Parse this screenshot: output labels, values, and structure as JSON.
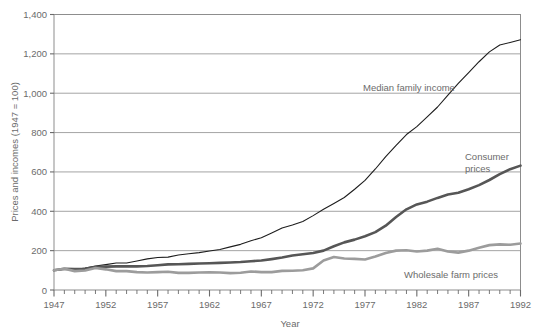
{
  "chart_data": {
    "type": "line",
    "title": "",
    "xlabel": "Year",
    "ylabel": "Prices and incomes (1947 = 100)",
    "xlim": [
      1947,
      1992
    ],
    "ylim": [
      0,
      1400
    ],
    "ytick_labels": [
      "0",
      "200",
      "400",
      "600",
      "800",
      "1,000",
      "1,200",
      "1,400"
    ],
    "ytick_values": [
      0,
      200,
      400,
      600,
      800,
      1000,
      1200,
      1400
    ],
    "xtick_labels": [
      "1947",
      "1952",
      "1957",
      "1962",
      "1967",
      "1972",
      "1977",
      "1982",
      "1987",
      "1992"
    ],
    "xtick_values": [
      1947,
      1952,
      1957,
      1962,
      1967,
      1972,
      1977,
      1982,
      1987,
      1992
    ],
    "grid": true,
    "legend_position": "inline-annotations",
    "x": [
      1947,
      1948,
      1949,
      1950,
      1951,
      1952,
      1953,
      1954,
      1955,
      1956,
      1957,
      1958,
      1959,
      1960,
      1961,
      1962,
      1963,
      1964,
      1965,
      1966,
      1967,
      1968,
      1969,
      1970,
      1971,
      1972,
      1973,
      1974,
      1975,
      1976,
      1977,
      1978,
      1979,
      1980,
      1981,
      1982,
      1983,
      1984,
      1985,
      1986,
      1987,
      1988,
      1989,
      1990,
      1991,
      1992
    ],
    "series": [
      {
        "name": "Median family income",
        "color": "#1d1d1d",
        "width": 1.1,
        "values": [
          100,
          105,
          104,
          112,
          122,
          129,
          137,
          137,
          147,
          158,
          165,
          167,
          178,
          184,
          190,
          198,
          206,
          219,
          232,
          250,
          266,
          290,
          315,
          330,
          348,
          378,
          410,
          440,
          470,
          512,
          557,
          615,
          678,
          735,
          790,
          830,
          880,
          930,
          990,
          1050,
          1105,
          1160,
          1210,
          1245,
          1258,
          1272
        ]
      },
      {
        "name": "Consumer prices",
        "color": "#565656",
        "width": 2.6,
        "values": [
          100,
          108,
          107,
          108,
          117,
          119,
          120,
          120,
          120,
          122,
          126,
          130,
          131,
          133,
          135,
          136,
          138,
          140,
          142,
          146,
          150,
          157,
          165,
          175,
          182,
          188,
          200,
          222,
          242,
          256,
          273,
          294,
          327,
          371,
          410,
          435,
          449,
          468,
          485,
          494,
          512,
          533,
          559,
          589,
          614,
          632
        ]
      },
      {
        "name": "Wholesale farm prices",
        "color": "#9c9c9c",
        "width": 2.6,
        "values": [
          100,
          108,
          96,
          99,
          112,
          105,
          96,
          96,
          91,
          89,
          91,
          93,
          87,
          87,
          89,
          90,
          89,
          86,
          88,
          94,
          91,
          91,
          97,
          98,
          100,
          110,
          150,
          168,
          160,
          158,
          155,
          170,
          188,
          200,
          202,
          196,
          200,
          210,
          196,
          190,
          200,
          215,
          228,
          232,
          230,
          236
        ]
      }
    ]
  },
  "annotations": [
    {
      "name": "median-family-income-label",
      "text": "Median family income"
    },
    {
      "name": "consumer-prices-label-line1",
      "text": "Consumer"
    },
    {
      "name": "consumer-prices-label-line2",
      "text": "prices"
    },
    {
      "name": "wholesale-farm-prices-label",
      "text": "Wholesale farm prices"
    }
  ]
}
